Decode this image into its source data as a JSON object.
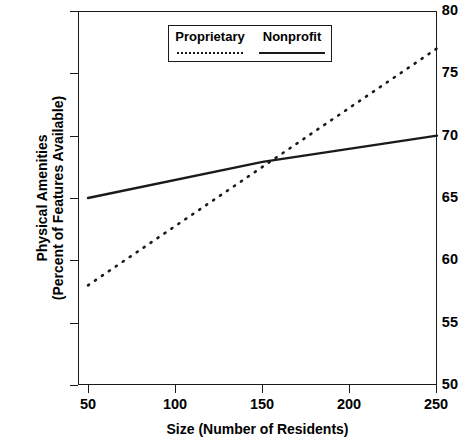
{
  "chart_data": {
    "type": "line",
    "title": "",
    "xlabel": "Size (Number of Residents)",
    "ylabel_lines": [
      "Physical Amenities",
      "(Percent of Features Available)"
    ],
    "ylabel": "Physical Amenities (Percent of Features Available)",
    "xlim": [
      50,
      250
    ],
    "ylim": [
      50,
      80
    ],
    "xticks": [
      50,
      100,
      150,
      200,
      250
    ],
    "yticks": [
      50,
      55,
      60,
      65,
      70,
      75,
      80
    ],
    "xtick_labels": [
      "50",
      "100",
      "150",
      "200",
      "250"
    ],
    "ytick_labels": [
      "50",
      "55",
      "60",
      "65",
      "70",
      "75",
      "80"
    ],
    "grid": false,
    "legend_position": "top-center",
    "line_color": "#1a1a1a",
    "series": [
      {
        "name": "Proprietary",
        "style": "dotted",
        "x": [
          50,
          250
        ],
        "values": [
          58,
          77
        ]
      },
      {
        "name": "Nonprofit",
        "style": "solid",
        "x": [
          50,
          150,
          250
        ],
        "values": [
          65,
          67.9,
          70
        ]
      }
    ],
    "annotations": [
      {
        "text": "",
        "note": "series cross near (155, 68)"
      }
    ]
  },
  "legend": {
    "entries": [
      {
        "label": "Proprietary",
        "style": "dotted"
      },
      {
        "label": "Nonprofit",
        "style": "solid"
      }
    ]
  }
}
